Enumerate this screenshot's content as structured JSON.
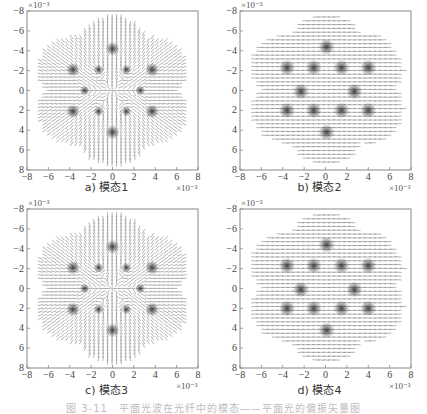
{
  "figure": {
    "caption": "图 3-11　平面光波在光纤中的模态——平面光的偏振矢量图"
  },
  "chart_data": [
    {
      "type": "quiver",
      "id": "a",
      "subcaption": "a) 模态1",
      "title": "",
      "xlabel": "",
      "ylabel": "",
      "xlim": [
        -8,
        8
      ],
      "ylim": [
        -8,
        8
      ],
      "y_inverted": true,
      "scale_label": "×10⁻³",
      "xticks": [
        "-8",
        "-6",
        "-4",
        "-2",
        "0",
        "2",
        "4",
        "6",
        "8"
      ],
      "yticks": [
        "-8",
        "-6",
        "-4",
        "-2",
        "0",
        "2",
        "4",
        "6",
        "8"
      ],
      "pattern": "radial",
      "singularities": [
        [
          0,
          -4.2
        ],
        [
          -3.7,
          -2.1
        ],
        [
          -1.3,
          -2.1
        ],
        [
          1.3,
          -2.1
        ],
        [
          3.7,
          -2.1
        ],
        [
          -2.6,
          0
        ],
        [
          2.6,
          0
        ],
        [
          -3.7,
          2.1
        ],
        [
          -1.3,
          2.1
        ],
        [
          1.3,
          2.1
        ],
        [
          3.7,
          2.1
        ],
        [
          0,
          4.2
        ]
      ]
    },
    {
      "type": "quiver",
      "id": "b",
      "subcaption": "b) 模态2",
      "title": "",
      "xlabel": "",
      "ylabel": "",
      "xlim": [
        -8,
        8
      ],
      "ylim": [
        -8,
        8
      ],
      "y_inverted": true,
      "scale_label": "×10⁻³",
      "xticks": [
        "-8",
        "-6",
        "-4",
        "-2",
        "0",
        "2",
        "4",
        "6",
        "8"
      ],
      "yticks": [
        "-8",
        "-6",
        "-4",
        "-2",
        "0",
        "2",
        "4",
        "6",
        "8"
      ],
      "pattern": "horizontal",
      "singularities": [
        [
          0.1,
          -4.4
        ],
        [
          -3.6,
          -2.3
        ],
        [
          -1.1,
          -2.3
        ],
        [
          1.5,
          -2.3
        ],
        [
          4.0,
          -2.3
        ],
        [
          -2.3,
          0.1
        ],
        [
          2.7,
          0.1
        ],
        [
          -3.6,
          2.0
        ],
        [
          -1.1,
          2.0
        ],
        [
          1.5,
          2.0
        ],
        [
          4.0,
          2.0
        ],
        [
          0.1,
          4.2
        ]
      ]
    },
    {
      "type": "quiver",
      "id": "c",
      "subcaption": "c) 模态3",
      "title": "",
      "xlabel": "",
      "ylabel": "",
      "xlim": [
        -8,
        8
      ],
      "ylim": [
        -8,
        8
      ],
      "y_inverted": true,
      "scale_label": "×10⁻³",
      "xticks": [
        "-8",
        "-6",
        "-4",
        "-2",
        "0",
        "2",
        "4",
        "6",
        "8"
      ],
      "yticks": [
        "-8",
        "-6",
        "-4",
        "-2",
        "0",
        "2",
        "4",
        "6",
        "8"
      ],
      "pattern": "radial",
      "singularities": [
        [
          0,
          -4.2
        ],
        [
          -3.7,
          -2.1
        ],
        [
          -1.3,
          -2.1
        ],
        [
          1.3,
          -2.1
        ],
        [
          3.7,
          -2.1
        ],
        [
          -2.6,
          0
        ],
        [
          2.6,
          0
        ],
        [
          -3.7,
          2.1
        ],
        [
          -1.3,
          2.1
        ],
        [
          1.3,
          2.1
        ],
        [
          3.7,
          2.1
        ],
        [
          0,
          4.2
        ]
      ]
    },
    {
      "type": "quiver",
      "id": "d",
      "subcaption": "d) 模态4",
      "title": "",
      "xlabel": "",
      "ylabel": "",
      "xlim": [
        -8,
        8
      ],
      "ylim": [
        -8,
        8
      ],
      "y_inverted": true,
      "scale_label": "×10⁻³",
      "xticks": [
        "-8",
        "-6",
        "-4",
        "-2",
        "0",
        "2",
        "4",
        "6",
        "8"
      ],
      "yticks": [
        "-8",
        "-6",
        "-4",
        "-2",
        "0",
        "2",
        "4",
        "6",
        "8"
      ],
      "pattern": "horizontal",
      "singularities": [
        [
          0.1,
          -4.4
        ],
        [
          -3.6,
          -2.3
        ],
        [
          -1.1,
          -2.3
        ],
        [
          1.5,
          -2.3
        ],
        [
          4.0,
          -2.3
        ],
        [
          -2.3,
          0.1
        ],
        [
          2.7,
          0.1
        ],
        [
          -3.6,
          2.0
        ],
        [
          -1.1,
          2.0
        ],
        [
          1.5,
          2.0
        ],
        [
          4.0,
          2.0
        ],
        [
          0.1,
          4.2
        ]
      ]
    }
  ],
  "style": {
    "axis_color": "#888888",
    "arrow_color": "#555555",
    "blob_color": "#222222"
  }
}
